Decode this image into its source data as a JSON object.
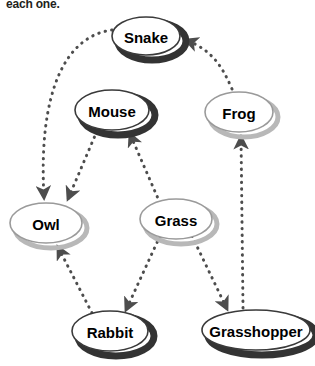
{
  "caption": "each one.",
  "colors": {
    "background": "#ffffff",
    "node_fill": "#ffffff",
    "outline_dark": "#3a3a3a",
    "outline_light": "#9a9a9a",
    "shadow_dark": "#333333",
    "shadow_light": "#b8b8b8",
    "text": "#000000",
    "arrow": "#4d4d4d"
  },
  "diagram": {
    "type": "food-web",
    "nodes": [
      {
        "id": "snake",
        "label": "Snake",
        "cx": 146,
        "cy": 36,
        "rx": 34,
        "ry": 19,
        "style": "dark"
      },
      {
        "id": "mouse",
        "label": "Mouse",
        "cx": 112,
        "cy": 110,
        "rx": 37,
        "ry": 20,
        "style": "dark"
      },
      {
        "id": "frog",
        "label": "Frog",
        "cx": 239,
        "cy": 112,
        "rx": 34,
        "ry": 20,
        "style": "light"
      },
      {
        "id": "owl",
        "label": "Owl",
        "cx": 46,
        "cy": 223,
        "rx": 36,
        "ry": 20,
        "style": "light"
      },
      {
        "id": "grass",
        "label": "Grass",
        "cx": 176,
        "cy": 219,
        "rx": 36,
        "ry": 20,
        "style": "light"
      },
      {
        "id": "rabbit",
        "label": "Rabbit",
        "cx": 110,
        "cy": 331,
        "rx": 38,
        "ry": 20,
        "style": "dark"
      },
      {
        "id": "grasshopper",
        "label": "Grasshopper",
        "cx": 256,
        "cy": 330,
        "rx": 54,
        "ry": 20,
        "style": "dark"
      }
    ],
    "edges": [
      {
        "id": "snake-owl",
        "from": "snake",
        "to": "owl",
        "label": ""
      },
      {
        "id": "mouse-owl",
        "from": "mouse",
        "to": "owl",
        "label": ""
      },
      {
        "id": "grass-mouse",
        "from": "grass",
        "to": "mouse",
        "label": ""
      },
      {
        "id": "rabbit-owl",
        "from": "rabbit",
        "to": "owl",
        "label": ""
      },
      {
        "id": "grass-rabbit",
        "from": "grass",
        "to": "rabbit",
        "label": ""
      },
      {
        "id": "grass-grasshopper",
        "from": "grass",
        "to": "grasshopper",
        "label": ""
      },
      {
        "id": "grasshopper-frog",
        "from": "grasshopper",
        "to": "frog",
        "label": ""
      },
      {
        "id": "frog-snake",
        "from": "frog",
        "to": "snake",
        "label": ""
      }
    ]
  }
}
